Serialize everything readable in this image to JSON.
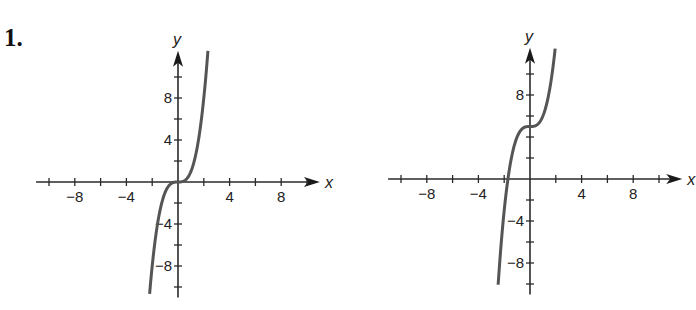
{
  "problem_number": "1.",
  "chart_data": [
    {
      "type": "line",
      "title": "",
      "xlabel": "x",
      "ylabel": "y",
      "function": "y = x^3",
      "xlim": [
        -11,
        11
      ],
      "ylim": [
        -11,
        12.5
      ],
      "x_ticks": [
        -10,
        -8,
        -6,
        -4,
        -2,
        0,
        2,
        4,
        6,
        8,
        10
      ],
      "x_tick_labels": [
        "-8",
        "-4",
        "4",
        "8"
      ],
      "x_labeled_values": [
        -8,
        -4,
        4,
        8
      ],
      "y_ticks": [
        -10,
        -8,
        -6,
        -4,
        -2,
        0,
        2,
        4,
        6,
        8,
        10
      ],
      "y_tick_labels": [
        "8",
        "4",
        "-4",
        "-8"
      ],
      "y_labeled_values": [
        8,
        4,
        -4,
        -8
      ],
      "grid": false,
      "curve_x_range": [
        -2.2,
        2.32
      ],
      "points": [
        [
          -2.2,
          -10.65
        ],
        [
          -2,
          -8
        ],
        [
          -1.5,
          -3.375
        ],
        [
          -1,
          -1
        ],
        [
          0,
          0
        ],
        [
          1,
          1
        ],
        [
          1.5,
          3.375
        ],
        [
          2,
          8
        ],
        [
          2.32,
          12.49
        ]
      ],
      "origin_px": [
        178,
        182
      ],
      "unit_px": [
        12.9,
        10.5
      ]
    },
    {
      "type": "line",
      "title": "",
      "xlabel": "x",
      "ylabel": "y",
      "function": "y = x^3 + 5",
      "xlim": [
        -11,
        11.8
      ],
      "ylim": [
        -11,
        12.5
      ],
      "x_ticks": [
        -10,
        -8,
        -6,
        -4,
        -2,
        0,
        2,
        4,
        6,
        8,
        10
      ],
      "x_tick_labels": [
        "-8",
        "-4",
        "4",
        "8"
      ],
      "x_labeled_values": [
        -8,
        -4,
        4,
        8
      ],
      "y_ticks": [
        -10,
        -8,
        -6,
        -4,
        -2,
        0,
        2,
        4,
        6,
        8,
        10
      ],
      "y_tick_labels": [
        "8",
        "-4",
        "-8"
      ],
      "y_labeled_values": [
        8,
        -4,
        -8
      ],
      "grid": false,
      "curve_x_range": [
        -2.47,
        1.95
      ],
      "points": [
        [
          -2.47,
          -10.07
        ],
        [
          -2,
          -3
        ],
        [
          -1.71,
          0
        ],
        [
          -1,
          4
        ],
        [
          0,
          5
        ],
        [
          1,
          6
        ],
        [
          1.5,
          8.375
        ],
        [
          1.95,
          12.41
        ]
      ],
      "origin_px": [
        530,
        179
      ],
      "unit_px": [
        12.9,
        10.5
      ]
    }
  ]
}
